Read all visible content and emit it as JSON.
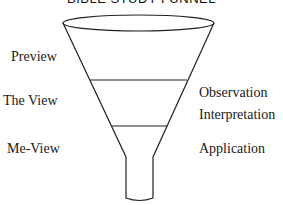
{
  "title": "BIBLE STUDY FUNNEL",
  "left_labels": [
    "Preview",
    "The View",
    "Me-View"
  ],
  "right_labels": [
    "Observation",
    "Interpretation",
    "Application"
  ],
  "colors": {
    "stroke": "#222222",
    "text": "#1a1a1a",
    "background": "#ffffff"
  }
}
